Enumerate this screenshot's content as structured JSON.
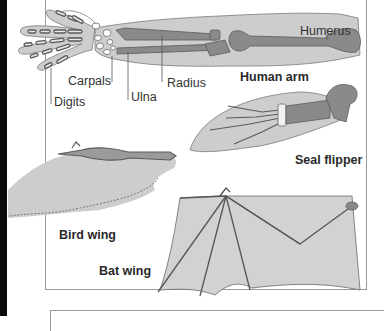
{
  "diagram": {
    "illustrations": [
      {
        "id": "human-arm",
        "title": "Human arm",
        "labels": [
          "Humerus",
          "Radius",
          "Ulna",
          "Carpals",
          "Digits"
        ]
      },
      {
        "id": "seal-flipper",
        "title": "Seal flipper"
      },
      {
        "id": "bird-wing",
        "title": "Bird wing"
      },
      {
        "id": "bat-wing",
        "title": "Bat wing"
      }
    ]
  },
  "colors": {
    "skin": "#c8c8c8",
    "bone": "#8a8a8a",
    "bone_outline": "#5a5a5a",
    "frame": "#9a9a9a",
    "text": "#333333"
  }
}
